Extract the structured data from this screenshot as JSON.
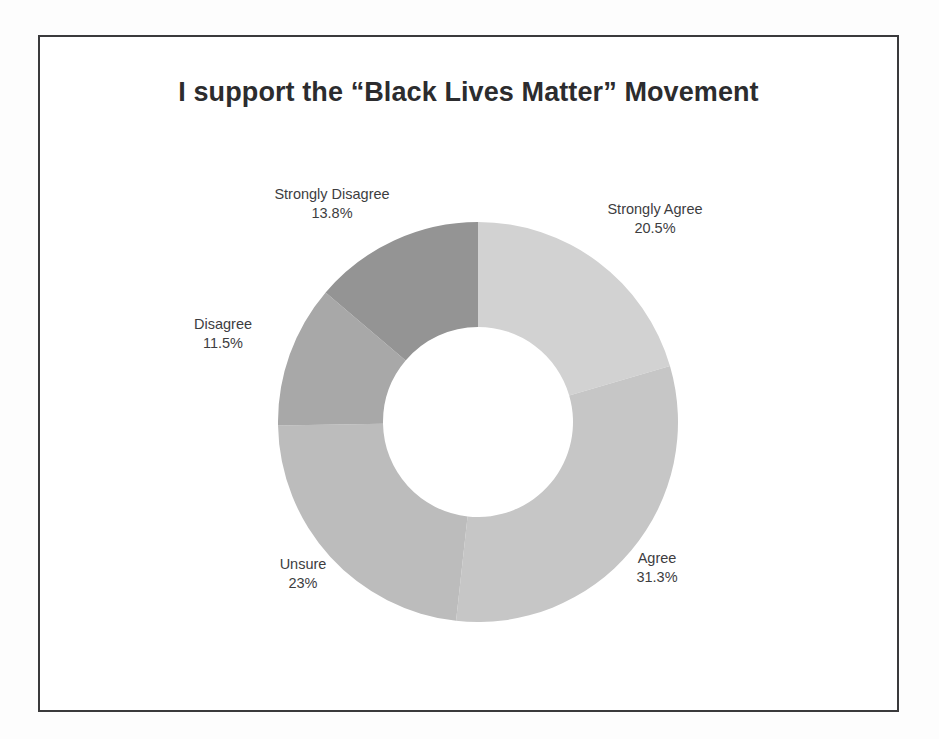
{
  "page": {
    "background_color": "#fdfdfd",
    "frame_border_color": "#3a3a3c"
  },
  "chart_data": {
    "type": "pie",
    "variant": "donut",
    "title": "I support the “Black Lives Matter” Movement",
    "xlabel": "",
    "ylabel": "",
    "legend_position": "none",
    "labels_outside": true,
    "start_angle_deg": 0,
    "direction": "clockwise",
    "inner_radius_ratio": 0.475,
    "categories": [
      "Strongly Agree",
      "Agree",
      "Unsure",
      "Disagree",
      "Strongly Disagree"
    ],
    "values": [
      20.5,
      31.3,
      23,
      11.5,
      13.8
    ],
    "value_labels": [
      "20.5%",
      "31.3%",
      "23%",
      "11.5%",
      "13.8%"
    ],
    "colors": [
      "#d2d2d2",
      "#c6c6c6",
      "#bcbcbc",
      "#a8a8a8",
      "#949494"
    ],
    "slices": [
      {
        "name": "Strongly Agree",
        "value": 20.5,
        "value_label": "20.5%",
        "color": "#d2d2d2",
        "start_angle_deg": 0,
        "end_angle_deg": 73.8
      },
      {
        "name": "Agree",
        "value": 31.3,
        "value_label": "31.3%",
        "color": "#c6c6c6",
        "start_angle_deg": 73.8,
        "end_angle_deg": 186.48
      },
      {
        "name": "Unsure",
        "value": 23,
        "value_label": "23%",
        "color": "#bcbcbc",
        "start_angle_deg": 186.48,
        "end_angle_deg": 269.28
      },
      {
        "name": "Disagree",
        "value": 11.5,
        "value_label": "11.5%",
        "color": "#a8a8a8",
        "start_angle_deg": 269.28,
        "end_angle_deg": 310.68
      },
      {
        "name": "Strongly Disagree",
        "value": 13.8,
        "value_label": "13.8%",
        "color": "#949494",
        "start_angle_deg": 310.68,
        "end_angle_deg": 360
      }
    ]
  }
}
